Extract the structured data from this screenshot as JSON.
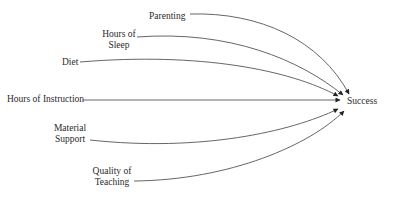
{
  "diagram": {
    "type": "causal-factors",
    "target": {
      "id": "success",
      "label": "Success"
    },
    "factors": [
      {
        "id": "parenting",
        "lines": [
          "Parenting"
        ]
      },
      {
        "id": "hours-of-sleep",
        "lines": [
          "Hours of",
          "Sleep"
        ]
      },
      {
        "id": "diet",
        "lines": [
          "Diet"
        ]
      },
      {
        "id": "hours-of-instruction",
        "lines": [
          "Hours of Instruction"
        ]
      },
      {
        "id": "material-support",
        "lines": [
          "Material",
          "Support"
        ]
      },
      {
        "id": "quality-of-teaching",
        "lines": [
          "Quality of",
          "Teaching"
        ]
      }
    ],
    "edges": [
      {
        "from": "parenting",
        "to": "success"
      },
      {
        "from": "hours-of-sleep",
        "to": "success"
      },
      {
        "from": "diet",
        "to": "success"
      },
      {
        "from": "hours-of-instruction",
        "to": "success"
      },
      {
        "from": "material-support",
        "to": "success"
      },
      {
        "from": "quality-of-teaching",
        "to": "success"
      }
    ],
    "colors": {
      "line": "#555555",
      "text": "#2a2a2a",
      "background": "#ffffff"
    }
  }
}
